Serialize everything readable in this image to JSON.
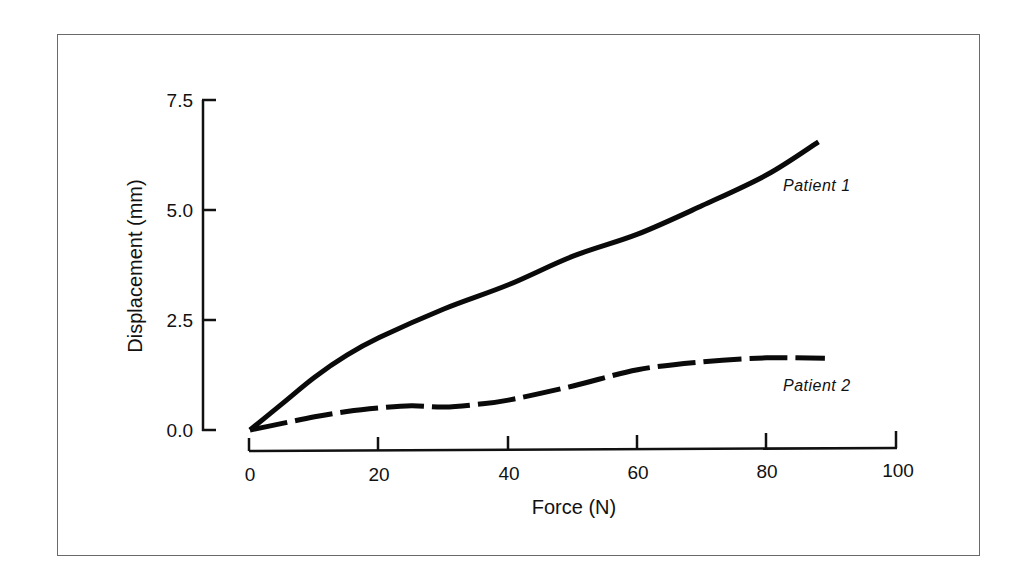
{
  "chart_data": {
    "type": "line",
    "title": "",
    "xlabel": "Force (N)",
    "ylabel": "Displacement (mm)",
    "xlim": [
      0,
      100
    ],
    "ylim": [
      0,
      7.5
    ],
    "x_ticks": [
      "0",
      "20",
      "40",
      "60",
      "80",
      "100"
    ],
    "y_ticks": [
      "0.0",
      "2.5",
      "5.0",
      "7.5"
    ],
    "grid": false,
    "legend_position": "inline labels at right end of curves",
    "series": [
      {
        "name": "Patient 1",
        "style": "solid",
        "x": [
          0,
          5,
          10,
          15,
          20,
          30,
          40,
          50,
          60,
          70,
          80,
          88
        ],
        "values": [
          0.0,
          0.6,
          1.2,
          1.7,
          2.1,
          2.75,
          3.3,
          3.95,
          4.45,
          5.1,
          5.8,
          6.55
        ]
      },
      {
        "name": "Patient 2",
        "style": "dashed",
        "x": [
          0,
          5,
          10,
          15,
          20,
          25,
          30,
          35,
          40,
          50,
          60,
          70,
          80,
          89
        ],
        "values": [
          0.0,
          0.15,
          0.3,
          0.42,
          0.5,
          0.55,
          0.52,
          0.58,
          0.68,
          1.0,
          1.37,
          1.55,
          1.64,
          1.63
        ]
      }
    ]
  },
  "labels": {
    "x_axis_title": "Force (N)",
    "y_axis_title": "Displacement (mm)",
    "series_1": "Patient 1",
    "series_2": "Patient 2",
    "x_ticks": [
      "0",
      "20",
      "40",
      "60",
      "80",
      "100"
    ],
    "y_ticks": [
      "0.0",
      "2.5",
      "5.0",
      "7.5"
    ]
  }
}
